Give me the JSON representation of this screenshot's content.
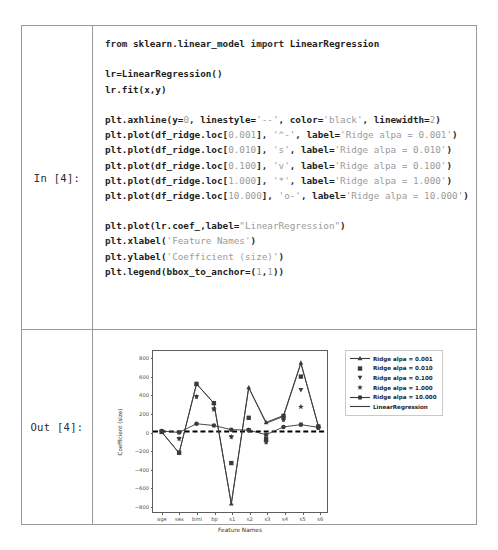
{
  "notebook": {
    "input_prompt": "In [4]:",
    "output_prompt": "Out [4]:",
    "code_lines": [
      [
        {
          "t": "from ",
          "c": "kw"
        },
        {
          "t": "sklearn.linear_model ",
          "c": "bold"
        },
        {
          "t": "import ",
          "c": "kw"
        },
        {
          "t": "LinearRegression",
          "c": "bold"
        }
      ],
      [],
      [
        {
          "t": "lr=LinearRegression()",
          "c": "bold"
        }
      ],
      [
        {
          "t": "lr.fit(x,y)",
          "c": "bold"
        }
      ],
      [],
      [
        {
          "t": "plt.axhline(y=",
          "c": "bold"
        },
        {
          "t": "0",
          "c": "num"
        },
        {
          "t": ", linestyle=",
          "c": "bold"
        },
        {
          "t": "'--'",
          "c": "str"
        },
        {
          "t": ", color=",
          "c": "bold"
        },
        {
          "t": "'black'",
          "c": "str"
        },
        {
          "t": ", linewidth=",
          "c": "bold"
        },
        {
          "t": "2",
          "c": "num"
        },
        {
          "t": ")",
          "c": "bold"
        }
      ],
      [
        {
          "t": "plt.plot(df_ridge.loc[",
          "c": "bold"
        },
        {
          "t": "0.001",
          "c": "num"
        },
        {
          "t": "], ",
          "c": "bold"
        },
        {
          "t": "'^-'",
          "c": "str"
        },
        {
          "t": ", label=",
          "c": "bold"
        },
        {
          "t": "'Ridge alpa = 0.001'",
          "c": "str"
        },
        {
          "t": ")",
          "c": "bold"
        }
      ],
      [
        {
          "t": "plt.plot(df_ridge.loc[",
          "c": "bold"
        },
        {
          "t": "0.010",
          "c": "num"
        },
        {
          "t": "], ",
          "c": "bold"
        },
        {
          "t": "'s'",
          "c": "str"
        },
        {
          "t": ", label=",
          "c": "bold"
        },
        {
          "t": "'Ridge alpa = 0.010'",
          "c": "str"
        },
        {
          "t": ")",
          "c": "bold"
        }
      ],
      [
        {
          "t": "plt.plot(df_ridge.loc[",
          "c": "bold"
        },
        {
          "t": "0.100",
          "c": "num"
        },
        {
          "t": "], ",
          "c": "bold"
        },
        {
          "t": "'v'",
          "c": "str"
        },
        {
          "t": ", label=",
          "c": "bold"
        },
        {
          "t": "'Ridge alpa = 0.100'",
          "c": "str"
        },
        {
          "t": ")",
          "c": "bold"
        }
      ],
      [
        {
          "t": "plt.plot(df_ridge.loc[",
          "c": "bold"
        },
        {
          "t": "1.000",
          "c": "num"
        },
        {
          "t": "], ",
          "c": "bold"
        },
        {
          "t": "'*'",
          "c": "str"
        },
        {
          "t": ", label=",
          "c": "bold"
        },
        {
          "t": "'Ridge alpa = 1.000'",
          "c": "str"
        },
        {
          "t": ")",
          "c": "bold"
        }
      ],
      [
        {
          "t": "plt.plot(df_ridge.loc[",
          "c": "bold"
        },
        {
          "t": "10.000",
          "c": "num"
        },
        {
          "t": "], ",
          "c": "bold"
        },
        {
          "t": "'o-'",
          "c": "str"
        },
        {
          "t": ", label=",
          "c": "bold"
        },
        {
          "t": "'Ridge alpa = 10.000'",
          "c": "str"
        },
        {
          "t": ")",
          "c": "bold"
        }
      ],
      [],
      [
        {
          "t": "plt.plot(lr.coef_,label=",
          "c": "bold"
        },
        {
          "t": "\"LinearRegression\"",
          "c": "str"
        },
        {
          "t": ")",
          "c": "bold"
        }
      ],
      [
        {
          "t": "plt.xlabel(",
          "c": "bold"
        },
        {
          "t": "'Feature Names'",
          "c": "str"
        },
        {
          "t": ")",
          "c": "bold"
        }
      ],
      [
        {
          "t": "plt.ylabel(",
          "c": "bold"
        },
        {
          "t": "'Coefficient (size)'",
          "c": "str"
        },
        {
          "t": ")",
          "c": "bold"
        }
      ],
      [
        {
          "t": "plt.legend(bbox_to_anchor=(",
          "c": "bold"
        },
        {
          "t": "1",
          "c": "num"
        },
        {
          "t": ",",
          "c": "bold"
        },
        {
          "t": "1",
          "c": "num"
        },
        {
          "t": "))",
          "c": "bold"
        }
      ]
    ]
  },
  "chart_data": {
    "type": "line",
    "title": "",
    "xlabel": "Feature Names",
    "ylabel": "Coefficient (size)",
    "categories": [
      "age",
      "sex",
      "bmi",
      "bp",
      "s1",
      "s2",
      "s3",
      "s4",
      "s5",
      "s6"
    ],
    "ylim": [
      -880,
      880
    ],
    "yticks": [
      800,
      600,
      400,
      200,
      0,
      -200,
      -400,
      -600,
      -800
    ],
    "grid": false,
    "legend_position": "upper right outside",
    "axhline": {
      "y": 0,
      "linestyle": "--",
      "color": "#000000",
      "linewidth": 2
    },
    "series": [
      {
        "name": "Ridge alpa = 0.001",
        "marker": "^",
        "linestyle": "-",
        "values": [
          -5,
          -235,
          520,
          310,
          -790,
          480,
          100,
          175,
          750,
          60
        ]
      },
      {
        "name": "Ridge alpa = 0.010",
        "marker": "s",
        "linestyle": "none",
        "values": [
          -5,
          -230,
          520,
          310,
          -345,
          150,
          -80,
          170,
          600,
          55
        ]
      },
      {
        "name": "Ridge alpa = 0.100",
        "marker": "v",
        "linestyle": "none",
        "values": [
          0,
          -80,
          380,
          245,
          -60,
          20,
          -120,
          130,
          455,
          40
        ]
      },
      {
        "name": "Ridge alpa = 1.000",
        "marker": "*",
        "linestyle": "none",
        "values": [
          0,
          -78,
          380,
          240,
          -58,
          15,
          -115,
          128,
          270,
          38
        ]
      },
      {
        "name": "Ridge alpa = 10.000",
        "marker": "o",
        "linestyle": "-",
        "values": [
          5,
          -10,
          85,
          65,
          20,
          15,
          -35,
          50,
          75,
          45
        ]
      },
      {
        "name": "LinearRegression",
        "marker": "none",
        "linestyle": "-",
        "values": [
          -5,
          -235,
          520,
          310,
          -790,
          480,
          90,
          165,
          745,
          60
        ]
      }
    ]
  }
}
